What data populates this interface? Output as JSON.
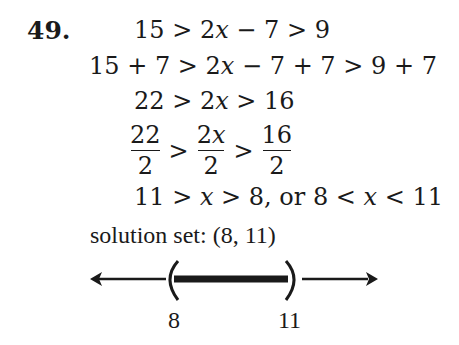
{
  "problem": {
    "number": "49.",
    "steps": [
      {
        "parts": [
          "15 > 2",
          "x",
          " − 7 > 9"
        ]
      },
      {
        "parts": [
          "15 + 7 > 2",
          "x",
          " − 7 + 7 > 9 + 7"
        ]
      },
      {
        "parts": [
          "22 > 2",
          "x",
          " > 16"
        ]
      },
      {
        "fractions": [
          {
            "num": "22",
            "den": "2"
          },
          {
            "num": "2x",
            "den": "2"
          },
          {
            "num": "16",
            "den": "2"
          }
        ],
        "operator": ">"
      },
      {
        "parts": [
          "11 > ",
          "x",
          " > 8, or 8 < ",
          "x",
          " < 11"
        ]
      }
    ],
    "solution_label": "solution set: (8, 11)",
    "number_line": {
      "left_label": "8",
      "right_label": "11",
      "left_bracket": "(",
      "right_bracket": ")",
      "interval": "open",
      "shaded_from": 8,
      "shaded_to": 11
    }
  }
}
